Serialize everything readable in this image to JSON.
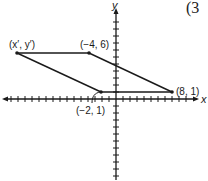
{
  "problem_number": "(3",
  "axes": {
    "x_label": "x",
    "y_label": "y"
  },
  "points": [
    {
      "id": "image",
      "label": "(x′, y′)"
    },
    {
      "id": "p1",
      "label": "(−4, 6)"
    },
    {
      "id": "p2",
      "label": "(8, 1)"
    },
    {
      "id": "p3",
      "label": "(−2, 1)"
    }
  ],
  "colors": {
    "ink": "#1a1a1a",
    "background": "#ffffff"
  }
}
